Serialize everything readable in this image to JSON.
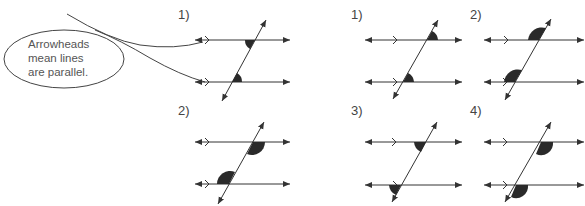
{
  "callout": {
    "lines": [
      "Arrowheads",
      "mean lines",
      "are parallel."
    ]
  },
  "left_examples": [
    {
      "label": "1)",
      "pair": "alternate interior angles"
    },
    {
      "label": "2)",
      "pair": "alternate interior angles"
    }
  ],
  "right_examples": [
    {
      "label": "1)"
    },
    {
      "label": "2)"
    },
    {
      "label": "3)"
    },
    {
      "label": "4)"
    }
  ],
  "colors": {
    "line": "#333333",
    "shade": "#2a2a2a",
    "text": "#444444"
  }
}
